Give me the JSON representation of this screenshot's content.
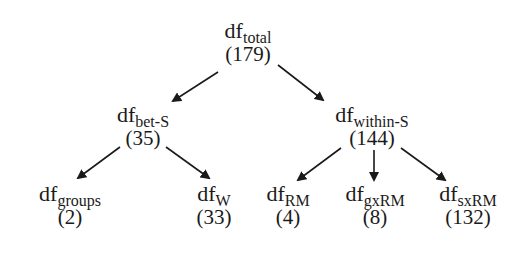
{
  "diagram": {
    "type": "tree",
    "nodes": [
      {
        "id": "total",
        "base": "df",
        "sub": "total",
        "value": "(179)"
      },
      {
        "id": "bet",
        "base": "df",
        "sub": "bet-S",
        "value": "(35)"
      },
      {
        "id": "within",
        "base": "df",
        "sub": "within-S",
        "value": "(144)"
      },
      {
        "id": "groups",
        "base": "df",
        "sub": "groups",
        "value": "(2)"
      },
      {
        "id": "w",
        "base": "df",
        "sub": "W",
        "value": "(33)"
      },
      {
        "id": "rm",
        "base": "df",
        "sub": "RM",
        "value": "(4)"
      },
      {
        "id": "gxrm",
        "base": "df",
        "sub": "gxRM",
        "value": "(8)"
      },
      {
        "id": "sxrm",
        "base": "df",
        "sub": "sxRM",
        "value": "(132)"
      }
    ],
    "edges": [
      [
        "total",
        "bet"
      ],
      [
        "total",
        "within"
      ],
      [
        "bet",
        "groups"
      ],
      [
        "bet",
        "w"
      ],
      [
        "within",
        "rm"
      ],
      [
        "within",
        "gxrm"
      ],
      [
        "within",
        "sxrm"
      ]
    ],
    "line_color": "#1a1a1a"
  }
}
